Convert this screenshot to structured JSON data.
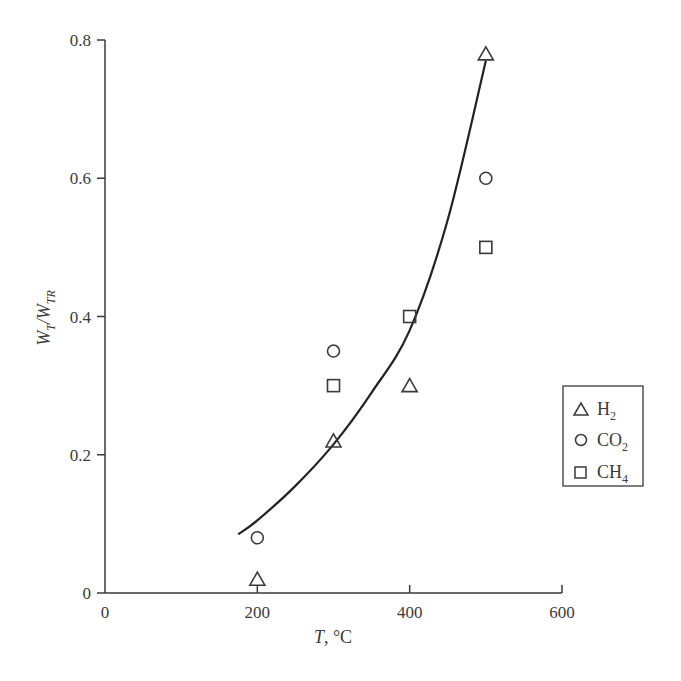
{
  "chart_data": {
    "type": "scatter",
    "title": "",
    "xlabel": "T, °C",
    "ylabel": "W_T/W_TR",
    "xlim": [
      0,
      600
    ],
    "ylim": [
      0,
      0.8
    ],
    "x_ticks": [
      0,
      200,
      400,
      600
    ],
    "y_ticks": [
      0,
      0.2,
      0.4,
      0.6,
      0.8
    ],
    "x_tick_labels": [
      "0",
      "200",
      "400",
      "600"
    ],
    "y_tick_labels": [
      "0",
      "0.2",
      "0.4",
      "0.6",
      "0.8"
    ],
    "grid": false,
    "legend_position": "right",
    "series": [
      {
        "name": "H2",
        "marker": "triangle",
        "x": [
          200,
          300,
          400,
          500
        ],
        "y": [
          0.02,
          0.22,
          0.3,
          0.78
        ]
      },
      {
        "name": "CO2",
        "marker": "circle",
        "x": [
          200,
          300,
          500
        ],
        "y": [
          0.08,
          0.35,
          0.6
        ]
      },
      {
        "name": "CH4",
        "marker": "square",
        "x": [
          300,
          400,
          500
        ],
        "y": [
          0.3,
          0.4,
          0.5
        ]
      },
      {
        "name": "fit",
        "marker": "line",
        "x": [
          175,
          200,
          250,
          300,
          350,
          400,
          450,
          500
        ],
        "y": [
          0.085,
          0.105,
          0.155,
          0.215,
          0.29,
          0.38,
          0.54,
          0.77
        ]
      }
    ]
  },
  "legend": {
    "items": [
      {
        "symbol": "triangle",
        "label": "H",
        "sub": "2"
      },
      {
        "symbol": "circle",
        "label": "CO",
        "sub": "2"
      },
      {
        "symbol": "square",
        "label": "CH",
        "sub": "4"
      }
    ]
  },
  "labels": {
    "x_axis_main": "T",
    "x_axis_unit": ", °C",
    "y_axis_w1": "W",
    "y_axis_sub1": "T",
    "y_axis_slash": "/",
    "y_axis_w2": "W",
    "y_axis_sub2": "TR"
  }
}
